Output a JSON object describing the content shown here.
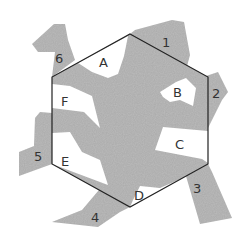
{
  "figure": {
    "type": "tessellation-diagram",
    "colors": {
      "lizard_fill": "#a9a9a9",
      "hexagon_stroke": "#222222",
      "background": "#ffffff",
      "label_color": "#333333"
    },
    "hexagon": {
      "vertices": [
        [
          130,
          34
        ],
        [
          208,
          77
        ],
        [
          208,
          164
        ],
        [
          130,
          207
        ],
        [
          52,
          164
        ],
        [
          52,
          77
        ]
      ]
    },
    "region_labels": [
      {
        "id": "A",
        "text": "A",
        "x": 104,
        "y": 67
      },
      {
        "id": "B",
        "text": "B",
        "x": 178,
        "y": 96
      },
      {
        "id": "C",
        "text": "C",
        "x": 183,
        "y": 147
      },
      {
        "id": "D",
        "text": "D",
        "x": 139,
        "y": 199
      },
      {
        "id": "E",
        "text": "E",
        "x": 66,
        "y": 165
      },
      {
        "id": "F",
        "text": "F",
        "x": 65,
        "y": 106
      }
    ],
    "edge_labels": [
      {
        "id": "1",
        "text": "1",
        "x": 166,
        "y": 45
      },
      {
        "id": "2",
        "text": "2",
        "x": 216,
        "y": 97
      },
      {
        "id": "3",
        "text": "3",
        "x": 197,
        "y": 192
      },
      {
        "id": "4",
        "text": "4",
        "x": 95,
        "y": 221
      },
      {
        "id": "5",
        "text": "5",
        "x": 38,
        "y": 160
      },
      {
        "id": "6",
        "text": "6",
        "x": 59,
        "y": 62
      }
    ]
  }
}
